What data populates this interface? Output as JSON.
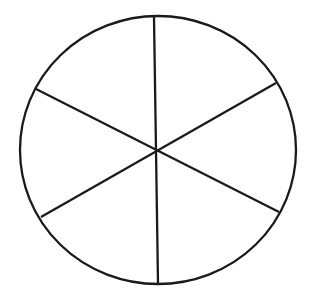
{
  "diagram": {
    "type": "circle-divided",
    "sections": 6,
    "stroke_color": "#1a1a1a",
    "background": "#ffffff",
    "circle": {
      "cx": 158,
      "cy": 150,
      "rx": 138,
      "ry": 134
    },
    "center": {
      "x": 155,
      "y": 151
    },
    "spokes": [
      {
        "x1": 154,
        "y1": 17,
        "x2": 158,
        "y2": 283
      },
      {
        "x1": 36,
        "y1": 89,
        "x2": 279,
        "y2": 212
      },
      {
        "x1": 276,
        "y1": 83,
        "x2": 41,
        "y2": 217
      }
    ]
  }
}
